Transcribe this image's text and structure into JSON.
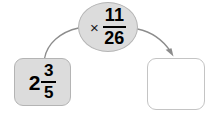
{
  "diagram": {
    "type": "function-machine",
    "background_color": "#ffffff",
    "input": {
      "label": "2 3/5",
      "whole": "2",
      "numerator": "3",
      "denominator": "5",
      "fill_color": "#dcdcdc",
      "border_color": "#b4b4b4"
    },
    "operator": {
      "symbol": "×",
      "symbol_name": "multiplication-sign",
      "label": "× 11/26",
      "numerator": "11",
      "denominator": "26",
      "fill_color": "#dcdcdc",
      "border_color": "#b4b4b4"
    },
    "output": {
      "value": "",
      "placeholder": "",
      "fill_color": "#ffffff",
      "border_color": "#c4c4c4"
    },
    "arrows": {
      "color": "#8c8c8c",
      "in_arrow_name": "arrow-input-to-operator",
      "out_arrow_name": "arrow-operator-to-output"
    }
  }
}
